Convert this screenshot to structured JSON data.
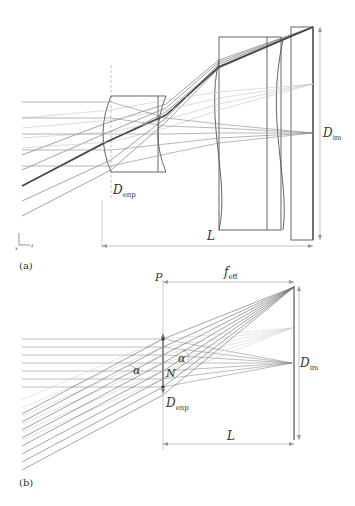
{
  "figure": {
    "panels": [
      {
        "id": "a",
        "caption": "(a)",
        "labels": {
          "entrance_pupil": "D",
          "entrance_pupil_sub": "enp",
          "image_diameter": "D",
          "image_diameter_sub": "im",
          "length": "L",
          "axis_y": "y",
          "axis_z": "z",
          "axis_x": "x"
        },
        "elements": [
          "meniscus lens group",
          "thick lens",
          "image plane window"
        ]
      },
      {
        "id": "b",
        "caption": "(b)",
        "labels": {
          "plane": "P",
          "focal_length": "f",
          "focal_length_sub": "eff",
          "node": "N",
          "angle_left": "α",
          "angle_right": "α",
          "entrance_pupil": "D",
          "entrance_pupil_sub": "enp",
          "image_diameter": "D",
          "image_diameter_sub": "im",
          "length": "L"
        }
      }
    ],
    "colors": {
      "line": "#555555",
      "light_line": "#bbbbbb",
      "dim_line": "#999999",
      "text": "#333333"
    }
  }
}
